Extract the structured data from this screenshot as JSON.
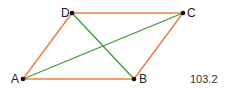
{
  "diagram": {
    "type": "parallelogram",
    "points": {
      "A": {
        "label": "A",
        "x": 23,
        "y": 79
      },
      "B": {
        "label": "B",
        "x": 134,
        "y": 79
      },
      "C": {
        "label": "C",
        "x": 183,
        "y": 13
      },
      "D": {
        "label": "D",
        "x": 72,
        "y": 13
      }
    },
    "sides": [
      "AB",
      "BC",
      "CD",
      "DA"
    ],
    "diagonals": [
      "AC",
      "BD"
    ],
    "colors": {
      "side": "#f08040",
      "diagonal": "#3a9a3a",
      "point": "#111111"
    },
    "value_label": "103.2"
  }
}
